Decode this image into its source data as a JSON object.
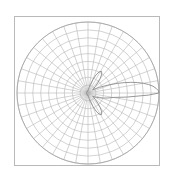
{
  "figure": {
    "title": "",
    "background_color": "#ffffff",
    "frame": {
      "x": 14,
      "y": 16,
      "width": 146,
      "height": 150,
      "stroke_color": "#b9b9b9",
      "stroke_width": 1
    }
  },
  "chart_data": {
    "type": "line",
    "plot_style": "polar",
    "title": "",
    "subtitle": "",
    "xlabel": "",
    "ylabel": "",
    "legend": [],
    "legend_position": "none",
    "grid": true,
    "annotations": [],
    "polar": {
      "center_x": 88,
      "center_y": 93,
      "outer_radius": 71,
      "ring_count": 9,
      "ring_radii": [
        7.9,
        15.8,
        23.7,
        31.6,
        39.4,
        47.3,
        55.2,
        63.1,
        71
      ],
      "spoke_count": 36,
      "spoke_step_degrees": 10,
      "theta_zero_location": "E",
      "theta_direction": "counterclockwise",
      "rlim": [
        0,
        1
      ],
      "rtick_labels": [],
      "thetatick_labels": [],
      "grid_color": "#b5b5b5",
      "grid_width": 0.6,
      "outer_circle_color": "#a8a8a8"
    },
    "series": [
      {
        "name": "radiation-pattern",
        "color": "#8c8c8c",
        "line_width": 0.9,
        "description": "antenna radiation pattern with narrow main lobe at 0 degrees and small side lobes",
        "theta_degrees": [
          0,
          2,
          4,
          6,
          8,
          10,
          12,
          14,
          16,
          18,
          20,
          22,
          24,
          26,
          28,
          30,
          34,
          38,
          42,
          46,
          50,
          54,
          58,
          62,
          66,
          70,
          74,
          78,
          82,
          86,
          90,
          100,
          110,
          120,
          130,
          140,
          150,
          160,
          170,
          180,
          190,
          200,
          210,
          220,
          230,
          240,
          250,
          260,
          270,
          274,
          278,
          282,
          286,
          290,
          294,
          298,
          302,
          306,
          310,
          314,
          318,
          322,
          326,
          330,
          334,
          338,
          342,
          346,
          350,
          354,
          358,
          360
        ],
        "r_values": [
          1.0,
          0.99,
          0.96,
          0.92,
          0.86,
          0.79,
          0.71,
          0.62,
          0.53,
          0.44,
          0.36,
          0.29,
          0.23,
          0.18,
          0.14,
          0.11,
          0.08,
          0.1,
          0.14,
          0.2,
          0.27,
          0.33,
          0.36,
          0.34,
          0.28,
          0.2,
          0.13,
          0.08,
          0.05,
          0.04,
          0.03,
          0.03,
          0.03,
          0.03,
          0.02,
          0.02,
          0.02,
          0.02,
          0.02,
          0.02,
          0.02,
          0.02,
          0.02,
          0.02,
          0.02,
          0.03,
          0.03,
          0.03,
          0.03,
          0.04,
          0.05,
          0.08,
          0.13,
          0.2,
          0.28,
          0.34,
          0.36,
          0.33,
          0.27,
          0.2,
          0.14,
          0.1,
          0.08,
          0.11,
          0.14,
          0.18,
          0.23,
          0.29,
          0.36,
          0.55,
          0.85,
          1.0
        ]
      }
    ]
  }
}
